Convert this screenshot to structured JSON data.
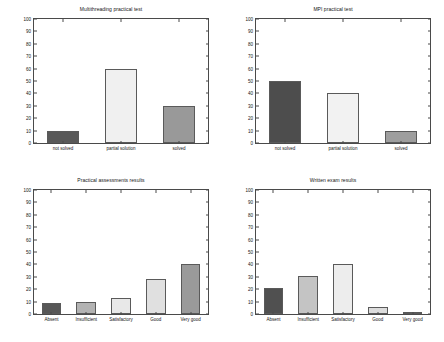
{
  "figure": {
    "background": "#ffffff",
    "axis_color": "#4a4a4a",
    "text_color": "#141414"
  },
  "chart_data": [
    {
      "id": "multithreading-practical-test",
      "type": "bar",
      "title": "Multithreading practical test",
      "xlabel": "",
      "ylabel": "",
      "ylim": [
        0,
        100
      ],
      "yticks": [
        0,
        10,
        20,
        30,
        40,
        50,
        60,
        70,
        80,
        90,
        100
      ],
      "grid": false,
      "legend": "none",
      "categories": [
        "not solved",
        "partial solution",
        "solved"
      ],
      "values": [
        10,
        60,
        30
      ],
      "bar_colors": [
        "#595959",
        "#f0f0f0",
        "#999999"
      ]
    },
    {
      "id": "mpi-practical-test",
      "type": "bar",
      "title": "MPI practical test",
      "xlabel": "",
      "ylabel": "",
      "ylim": [
        0,
        100
      ],
      "yticks": [
        0,
        10,
        20,
        30,
        40,
        50,
        60,
        70,
        80,
        90,
        100
      ],
      "grid": false,
      "legend": "none",
      "categories": [
        "not solved",
        "partial solution",
        "solved"
      ],
      "values": [
        50,
        40,
        10
      ],
      "bar_colors": [
        "#4d4d4d",
        "#f2f2f2",
        "#9e9e9e"
      ]
    },
    {
      "id": "practical-assessments-results",
      "type": "bar",
      "title": "Practical assessments results",
      "xlabel": "",
      "ylabel": "",
      "ylim": [
        0,
        100
      ],
      "yticks": [
        0,
        10,
        20,
        30,
        40,
        50,
        60,
        70,
        80,
        90,
        100
      ],
      "grid": false,
      "legend": "none",
      "categories": [
        "Absent",
        "Insufficient",
        "Satisfactory",
        "Good",
        "Very good"
      ],
      "values": [
        9,
        10,
        13,
        28,
        40
      ],
      "bar_colors": [
        "#575757",
        "#b3b3b3",
        "#e8e8e8",
        "#e0e0e0",
        "#9a9a9a"
      ]
    },
    {
      "id": "written-exam-results",
      "type": "bar",
      "title": "Written exam results",
      "xlabel": "",
      "ylabel": "",
      "ylim": [
        0,
        100
      ],
      "yticks": [
        0,
        10,
        20,
        30,
        40,
        50,
        60,
        70,
        80,
        90,
        100
      ],
      "grid": false,
      "legend": "none",
      "categories": [
        "Absent",
        "Insufficient",
        "Satisfactory",
        "Good",
        "Very good"
      ],
      "values": [
        21,
        31,
        40,
        6,
        2
      ],
      "bar_colors": [
        "#505050",
        "#c4c4c4",
        "#ededed",
        "#dcdcdc",
        "#a8a8a8"
      ]
    }
  ]
}
